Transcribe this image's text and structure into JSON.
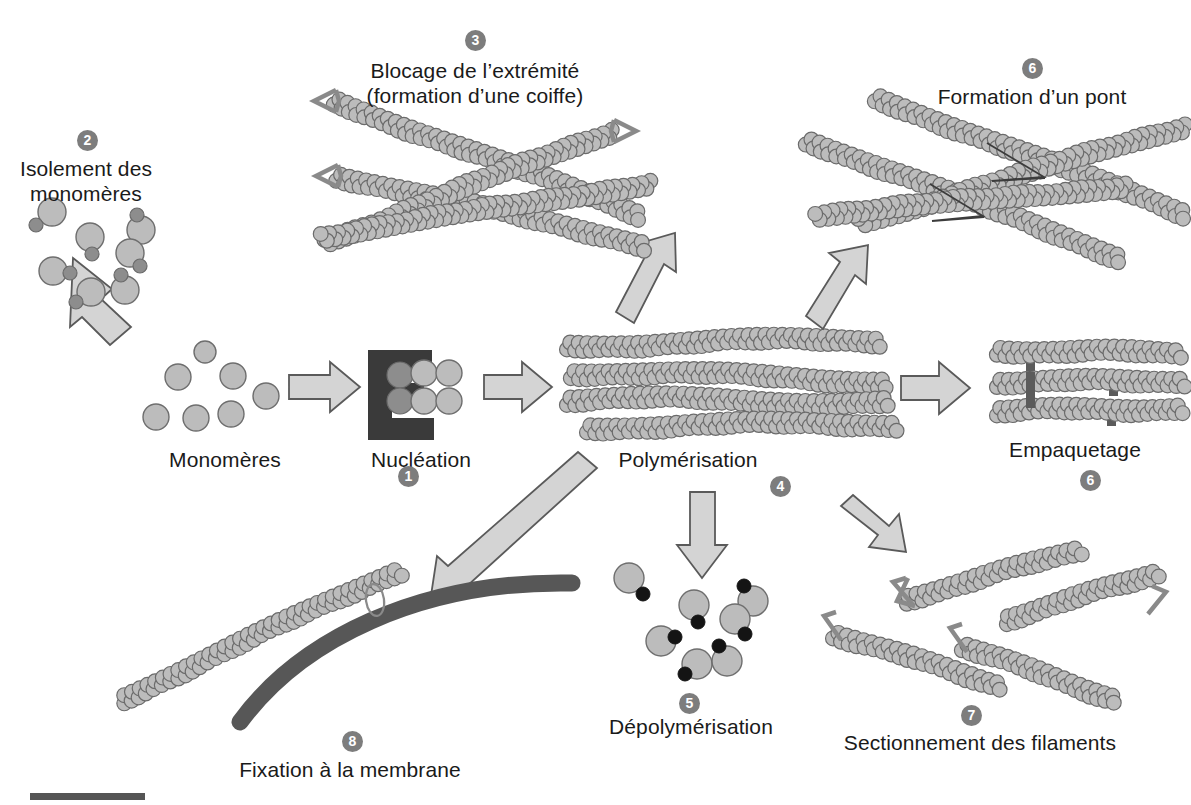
{
  "figure": {
    "title_absent": true,
    "background": "#ffffff",
    "language": "fr",
    "palette": {
      "monomer_fill": "#b8b8b8",
      "monomer_stroke": "#6e6e6e",
      "monomer_dot_gray": "#8a8a8a",
      "monomer_dot_black": "#141414",
      "arrow_fill": "#d2d2d2",
      "arrow_stroke": "#5a5a5a",
      "membrane": "#575757",
      "nucleator_dark": "#3a3a3a",
      "crosslink_bar": "#5b5b5b",
      "badge_bg": "#7d7d7d",
      "badge_text": "#ffffff",
      "text": "#1a1a1a",
      "scalebar": "#555555"
    }
  },
  "steps": [
    {
      "num": "1",
      "label": "",
      "badge_x": 398,
      "badge_y": 466
    },
    {
      "num": "2",
      "label": "Isolement des\nmonomères",
      "badge_x": 77,
      "badge_y": 130
    },
    {
      "num": "3",
      "label": "Blocage de l’extrémité\n(formation d’une coiffe)",
      "badge_x": 465,
      "badge_y": 30
    },
    {
      "num": "4",
      "label": "",
      "badge_x": 770,
      "badge_y": 476
    },
    {
      "num": "5",
      "label": "Dépolymérisation",
      "badge_x": 679,
      "badge_y": 693
    },
    {
      "num": "6",
      "label": "Formation d’un pont",
      "badge_x": 1022,
      "badge_y": 58
    },
    {
      "num": "6",
      "label": "",
      "badge_x": 1080,
      "badge_y": 470
    },
    {
      "num": "7",
      "label": "Sectionnement des filaments",
      "badge_x": 961,
      "badge_y": 705
    },
    {
      "num": "8",
      "label": "Fixation à la membrane",
      "badge_x": 342,
      "badge_y": 731
    }
  ],
  "labels": {
    "isolement_line1": "Isolement des",
    "isolement_line2": "monomères",
    "blocage_line1": "Blocage de l’extrémité",
    "blocage_line2": "(formation d’une coiffe)",
    "formation_pont": "Formation d’un pont",
    "monomeres": "Monomères",
    "nucleation": "Nucléation",
    "polymerisation": "Polymérisation",
    "empaquetage": "Empaquetage",
    "depolymerisation": "Dépolymérisation",
    "sectionnement": "Sectionnement des filaments",
    "fixation": "Fixation à la membrane"
  },
  "diagram_content": {
    "type": "process-diagram",
    "description": "Actin filament dynamics cycle with 8 numbered steps",
    "nodes": [
      {
        "id": "monomeres",
        "label": "Monomères",
        "badge": null,
        "kind": "free-monomer-cloud",
        "count": 7
      },
      {
        "id": "nucleation",
        "label": "Nucléation",
        "badge": null,
        "kind": "nucleator-with-seed",
        "seed_circles": 6
      },
      {
        "id": "polymerisation",
        "label": "Polymérisation",
        "badge": "4",
        "kind": "filament-bundle",
        "filaments": 4
      },
      {
        "id": "isolement",
        "label": "Isolement des monomères",
        "badge": "2",
        "kind": "sequestered-monomers",
        "count": 8
      },
      {
        "id": "blocage",
        "label": "Blocage de l’extrémité (formation d’une coiffe)",
        "badge": "3",
        "kind": "capped-crossed-filaments",
        "filaments": 4,
        "caps": 3
      },
      {
        "id": "pont",
        "label": "Formation d’un pont",
        "badge": "6",
        "kind": "cross-linked-filaments",
        "filaments": 4,
        "bridges": 2
      },
      {
        "id": "empaquetage",
        "label": "Empaquetage",
        "badge": "6",
        "kind": "bundled-filaments",
        "filaments": 3,
        "crosslinks": 3
      },
      {
        "id": "depolymerisation",
        "label": "Dépolymérisation",
        "badge": "5",
        "kind": "released-monomers",
        "count": 8
      },
      {
        "id": "sectionnement",
        "label": "Sectionnement des filaments",
        "badge": "7",
        "kind": "severed-filaments",
        "fragments": 4,
        "brackets": 4
      },
      {
        "id": "fixation",
        "label": "Fixation à la membrane",
        "badge": "8",
        "kind": "filament-anchored-to-membrane"
      }
    ],
    "edges": [
      {
        "from": "monomeres",
        "to": "nucleation",
        "style": "block-arrow-right"
      },
      {
        "from": "nucleation",
        "to": "polymerisation",
        "style": "block-arrow-right"
      },
      {
        "from": "monomeres",
        "to": "isolement",
        "style": "block-arrow-up-left"
      },
      {
        "from": "polymerisation",
        "to": "blocage",
        "style": "block-arrow-up-left"
      },
      {
        "from": "polymerisation",
        "to": "pont",
        "style": "block-arrow-up-right"
      },
      {
        "from": "polymerisation",
        "to": "empaquetage",
        "style": "block-arrow-right"
      },
      {
        "from": "polymerisation",
        "to": "depolymerisation",
        "style": "block-arrow-down"
      },
      {
        "from": "polymerisation",
        "to": "sectionnement",
        "style": "block-arrow-down-right"
      },
      {
        "from": "polymerisation",
        "to": "fixation",
        "style": "block-arrow-down-left-long"
      }
    ],
    "scalebar": {
      "x": 30,
      "y": 793,
      "width": 115,
      "height": 7
    }
  }
}
